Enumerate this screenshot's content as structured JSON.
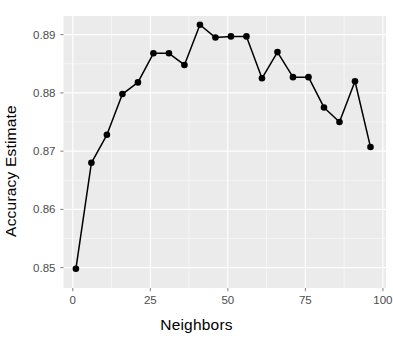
{
  "chart_data": {
    "type": "line",
    "title": "",
    "subtitle": "",
    "xlabel": "Neighbors",
    "ylabel": "Accuracy Estimate",
    "xlim": [
      -3,
      101
    ],
    "ylim": [
      0.8465,
      0.8932
    ],
    "xticks": [
      0,
      25,
      50,
      75,
      100
    ],
    "xticklabels": [
      "0",
      "25",
      "50",
      "75",
      "100"
    ],
    "yticks": [
      0.85,
      0.86,
      0.87,
      0.88,
      0.89
    ],
    "yticklabels": [
      "0.85",
      "0.86",
      "0.87",
      "0.88",
      "0.89"
    ],
    "grid": true,
    "grid_color": "#ffffff",
    "panel_background": "#ebebeb",
    "legend": null,
    "legend_position": "none",
    "annotations": [],
    "marker": "filled-circle",
    "marker_color": "#000000",
    "line_color": "#000000",
    "x": [
      1,
      6,
      11,
      16,
      21,
      26,
      31,
      36,
      41,
      46,
      51,
      56,
      61,
      66,
      71,
      76,
      81,
      86,
      91,
      96
    ],
    "y": [
      0.8498,
      0.868,
      0.8728,
      0.8798,
      0.8818,
      0.8868,
      0.8868,
      0.8848,
      0.8917,
      0.8895,
      0.8897,
      0.8897,
      0.8825,
      0.887,
      0.8827,
      0.8827,
      0.8775,
      0.875,
      0.882,
      0.8707
    ],
    "series": [
      {
        "name": "Accuracy Estimate",
        "x": [
          1,
          6,
          11,
          16,
          21,
          26,
          31,
          36,
          41,
          46,
          51,
          56,
          61,
          66,
          71,
          76,
          81,
          86,
          91,
          96
        ],
        "values": [
          0.8498,
          0.868,
          0.8728,
          0.8798,
          0.8818,
          0.8868,
          0.8868,
          0.8848,
          0.8917,
          0.8895,
          0.8897,
          0.8897,
          0.8825,
          0.887,
          0.8827,
          0.8827,
          0.8775,
          0.875,
          0.882,
          0.8707
        ]
      }
    ]
  }
}
